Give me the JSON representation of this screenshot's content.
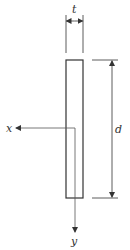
{
  "diagram": {
    "labels": {
      "thickness": "t",
      "depth": "d",
      "x_axis": "x",
      "y_axis": "y"
    },
    "colors": {
      "stroke": "#333333",
      "axis": "#555555",
      "background": "#ffffff"
    },
    "geometry": {
      "rect": {
        "x": 66,
        "y": 60,
        "width": 17,
        "height": 138
      },
      "centroid": {
        "x": 75,
        "y": 128
      }
    }
  }
}
